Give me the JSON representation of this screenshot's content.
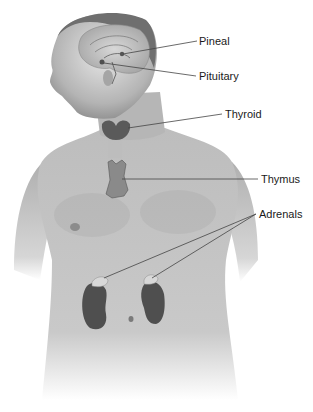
{
  "diagram": {
    "labels": [
      {
        "id": "pineal",
        "text": "Pineal",
        "x": 199,
        "y": 34,
        "line": [
          [
            200,
            41
          ],
          [
            152,
            50
          ]
        ]
      },
      {
        "id": "pituitary",
        "text": "Pituitary",
        "x": 199,
        "y": 69,
        "line": [
          [
            196,
            76
          ],
          [
            150,
            66
          ]
        ]
      },
      {
        "id": "thyroid",
        "text": "Thyroid",
        "x": 225,
        "y": 107,
        "line": [
          [
            222,
            114
          ],
          [
            135,
            128
          ]
        ]
      },
      {
        "id": "thymus",
        "text": "Thymus",
        "x": 261,
        "y": 172,
        "line": [
          [
            258,
            179
          ],
          [
            123,
            179
          ]
        ]
      },
      {
        "id": "adrenals",
        "text": "Adrenals",
        "x": 259,
        "y": 207,
        "lines": [
          [
            [
              256,
              214
            ],
            [
              104,
              277
            ]
          ],
          [
            [
              256,
              214
            ],
            [
              152,
              279
            ]
          ]
        ]
      }
    ]
  }
}
